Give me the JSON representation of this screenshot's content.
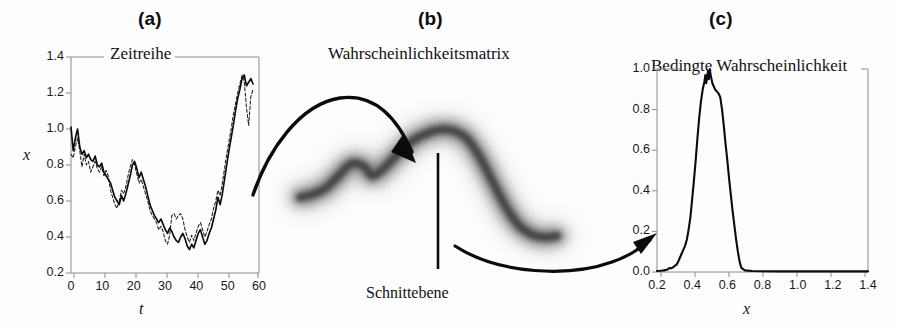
{
  "figure": {
    "background": "#fdfdfd",
    "ink": "#111111"
  },
  "panels": [
    {
      "key": "a",
      "label": "(a)",
      "title": "Zeitreihe",
      "xlabel": "t",
      "ylabel": "x"
    },
    {
      "key": "b",
      "label": "(b)",
      "title": "Wahrscheinlichkeitsmatrix",
      "annotation": "Schnittebene"
    },
    {
      "key": "c",
      "label": "(c)",
      "title": "Bedingte Wahrscheinlichkeit",
      "xlabel": "x"
    }
  ],
  "chart_data": [
    {
      "panel": "a",
      "type": "line",
      "title": "Zeitreihe",
      "xlabel": "t",
      "ylabel": "x",
      "xlim": [
        0,
        60
      ],
      "ylim": [
        0.2,
        1.4
      ],
      "xticks": [
        0,
        10,
        20,
        30,
        40,
        50,
        60
      ],
      "yticks": [
        0.2,
        0.4,
        0.6,
        0.8,
        1.0,
        1.2,
        1.4
      ],
      "xtick_labels": [
        "0",
        "10",
        "20",
        "30",
        "40",
        "50",
        "60"
      ],
      "ytick_labels": [
        "0.2",
        "0.4",
        "0.6",
        "0.8",
        "1.0",
        "1.2",
        "1.4"
      ],
      "grid": false,
      "legend": "none",
      "series": [
        {
          "name": "solid-trace",
          "style": "solid",
          "x": [
            0,
            0.7,
            1.4,
            2.1,
            2.8,
            3.5,
            4.2,
            4.9,
            5.6,
            6.3,
            7,
            7.7,
            8.4,
            9.1,
            9.8,
            10.5,
            11.2,
            11.9,
            12.6,
            13.3,
            14,
            14.7,
            15.4,
            16.1,
            16.8,
            17.5,
            18.2,
            18.9,
            19.6,
            20.3,
            21,
            21.7,
            22.4,
            23.1,
            23.8,
            24.5,
            25.2,
            25.9,
            26.6,
            27.3,
            28,
            28.7,
            29.4,
            30.1,
            30.8,
            31.5,
            32.2,
            32.9,
            33.6,
            34.3,
            35,
            35.7,
            36.4,
            37.1,
            37.8,
            38.5,
            39.2,
            39.9,
            40.6,
            41.3,
            42,
            42.7,
            43.4,
            44.1,
            44.8,
            45.5,
            46.2,
            46.9,
            47.6,
            48.3,
            49,
            49.7,
            50.4,
            51.1,
            51.8,
            52.5,
            53.2,
            53.9,
            54.6,
            55.3,
            56,
            56.7,
            57.4,
            58.1
          ],
          "y": [
            1.01,
            0.88,
            0.95,
            1.0,
            0.9,
            0.86,
            0.88,
            0.84,
            0.86,
            0.83,
            0.82,
            0.85,
            0.8,
            0.79,
            0.81,
            0.76,
            0.74,
            0.72,
            0.7,
            0.66,
            0.62,
            0.6,
            0.58,
            0.63,
            0.6,
            0.64,
            0.69,
            0.74,
            0.8,
            0.82,
            0.78,
            0.73,
            0.76,
            0.72,
            0.68,
            0.63,
            0.58,
            0.55,
            0.52,
            0.5,
            0.48,
            0.5,
            0.47,
            0.44,
            0.42,
            0.45,
            0.43,
            0.4,
            0.38,
            0.37,
            0.4,
            0.42,
            0.39,
            0.35,
            0.33,
            0.36,
            0.34,
            0.38,
            0.42,
            0.44,
            0.4,
            0.36,
            0.38,
            0.42,
            0.45,
            0.5,
            0.55,
            0.62,
            0.58,
            0.64,
            0.72,
            0.8,
            0.88,
            0.95,
            1.02,
            1.1,
            1.17,
            1.22,
            1.28,
            1.3,
            1.24,
            1.26,
            1.28,
            1.25,
            1.27,
            1.26
          ],
          "linewidth": 1.6
        },
        {
          "name": "dashed-trace",
          "style": "dashed",
          "x": [
            0,
            0.7,
            1.4,
            2.1,
            2.8,
            3.5,
            4.2,
            4.9,
            5.6,
            6.3,
            7,
            7.7,
            8.4,
            9.1,
            9.8,
            10.5,
            11.2,
            11.9,
            12.6,
            13.3,
            14,
            14.7,
            15.4,
            16.1,
            16.8,
            17.5,
            18.2,
            18.9,
            19.6,
            20.3,
            21,
            21.7,
            22.4,
            23.1,
            23.8,
            24.5,
            25.2,
            25.9,
            26.6,
            27.3,
            28,
            28.7,
            29.4,
            30.1,
            30.8,
            31.5,
            32.2,
            32.9,
            33.6,
            34.3,
            35,
            35.7,
            36.4,
            37.1,
            37.8,
            38.5,
            39.2,
            39.9,
            40.6,
            41.3,
            42,
            42.7,
            43.4,
            44.1,
            44.8,
            45.5,
            46.2,
            46.9,
            47.6,
            48.3,
            49,
            49.7,
            50.4,
            51.1,
            51.8,
            52.5,
            53.2,
            53.9,
            54.6,
            55.3,
            56,
            56.7,
            57.4,
            58.1
          ],
          "y": [
            0.86,
            0.84,
            0.9,
            0.95,
            0.88,
            0.79,
            0.86,
            0.8,
            0.82,
            0.76,
            0.79,
            0.82,
            0.78,
            0.76,
            0.79,
            0.74,
            0.77,
            0.74,
            0.66,
            0.62,
            0.58,
            0.56,
            0.6,
            0.66,
            0.64,
            0.68,
            0.74,
            0.79,
            0.83,
            0.8,
            0.75,
            0.7,
            0.72,
            0.68,
            0.64,
            0.6,
            0.55,
            0.52,
            0.5,
            0.48,
            0.44,
            0.46,
            0.43,
            0.38,
            0.36,
            0.41,
            0.52,
            0.53,
            0.5,
            0.52,
            0.53,
            0.5,
            0.44,
            0.4,
            0.37,
            0.41,
            0.38,
            0.42,
            0.46,
            0.48,
            0.44,
            0.4,
            0.43,
            0.47,
            0.5,
            0.56,
            0.6,
            0.66,
            0.63,
            0.7,
            0.78,
            0.86,
            0.93,
            1.0,
            1.08,
            1.14,
            1.2,
            1.25,
            1.3,
            1.26,
            1.12,
            1.02,
            1.18,
            1.22,
            1.2,
            1.14
          ],
          "linewidth": 1.1
        }
      ]
    },
    {
      "panel": "b",
      "type": "heatmap",
      "title": "Wahrscheinlichkeitsmatrix",
      "description": "blurred probability density band",
      "annotation": "Schnittebene",
      "cut_plane_x_fraction": 0.55,
      "band_path_y": [
        0.42,
        0.44,
        0.48,
        0.56,
        0.64,
        0.62,
        0.56,
        0.6,
        0.7,
        0.79,
        0.84,
        0.86,
        0.85,
        0.8,
        0.68,
        0.52,
        0.36,
        0.24,
        0.18,
        0.16,
        0.17
      ],
      "band_path_x": [
        0.0,
        0.05,
        0.1,
        0.15,
        0.2,
        0.25,
        0.28,
        0.32,
        0.38,
        0.44,
        0.5,
        0.55,
        0.6,
        0.65,
        0.7,
        0.75,
        0.8,
        0.85,
        0.9,
        0.95,
        1.0
      ]
    },
    {
      "panel": "c",
      "type": "line",
      "title": "Bedingte Wahrscheinlichkeit",
      "xlabel": "x",
      "ylabel": "",
      "xlim": [
        0.2,
        1.4
      ],
      "ylim": [
        0.0,
        1.0
      ],
      "xticks": [
        0.2,
        0.4,
        0.6,
        0.8,
        1.0,
        1.2,
        1.4
      ],
      "yticks": [
        0.0,
        0.2,
        0.4,
        0.6,
        0.8,
        1.0
      ],
      "xtick_labels": [
        "0.2",
        "0.4",
        "0.6",
        "0.8",
        "1.0",
        "1.2",
        "1.4"
      ],
      "ytick_labels": [
        "0.0",
        "0.2",
        "0.4",
        "0.6",
        "0.8",
        "1.0"
      ],
      "grid": false,
      "legend": "none",
      "series": [
        {
          "name": "conditional-density",
          "style": "solid",
          "x": [
            0.2,
            0.22,
            0.24,
            0.26,
            0.27,
            0.28,
            0.29,
            0.3,
            0.31,
            0.32,
            0.33,
            0.34,
            0.35,
            0.36,
            0.37,
            0.38,
            0.39,
            0.4,
            0.41,
            0.42,
            0.43,
            0.44,
            0.45,
            0.46,
            0.47,
            0.475,
            0.48,
            0.485,
            0.49,
            0.495,
            0.5,
            0.505,
            0.51,
            0.515,
            0.52,
            0.53,
            0.54,
            0.55,
            0.56,
            0.57,
            0.58,
            0.59,
            0.6,
            0.61,
            0.62,
            0.63,
            0.64,
            0.65,
            0.66,
            0.67,
            0.68,
            0.7,
            0.74,
            0.8,
            0.9,
            1.0,
            1.1,
            1.2,
            1.3,
            1.4
          ],
          "y": [
            0.005,
            0.006,
            0.008,
            0.012,
            0.02,
            0.018,
            0.022,
            0.03,
            0.035,
            0.05,
            0.07,
            0.09,
            0.11,
            0.13,
            0.16,
            0.21,
            0.27,
            0.36,
            0.45,
            0.55,
            0.66,
            0.76,
            0.84,
            0.9,
            0.94,
            0.97,
            0.93,
            0.96,
            0.99,
            0.95,
            1.0,
            0.97,
            0.95,
            0.93,
            0.92,
            0.9,
            0.89,
            0.88,
            0.86,
            0.8,
            0.72,
            0.63,
            0.55,
            0.46,
            0.38,
            0.3,
            0.23,
            0.16,
            0.1,
            0.05,
            0.02,
            0.008,
            0.005,
            0.004,
            0.003,
            0.003,
            0.003,
            0.003,
            0.003,
            0.003
          ],
          "linewidth": 2.0
        }
      ]
    }
  ],
  "arrows": [
    {
      "name": "arrow-a-to-b",
      "from_panel": "a",
      "to_panel": "b"
    },
    {
      "name": "arrow-b-to-c",
      "from_panel": "b",
      "to_panel": "c"
    }
  ]
}
